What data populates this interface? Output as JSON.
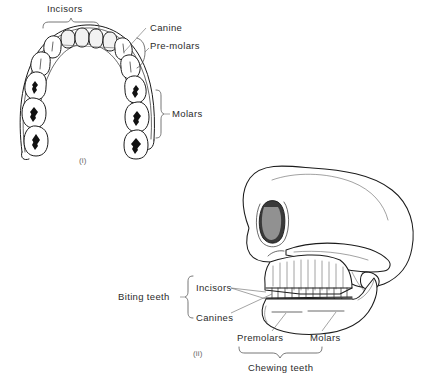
{
  "figure": {
    "background_color": "#ffffff",
    "ink_color": "#1b1b1b",
    "label_color": "#2b2b2b",
    "panels": [
      {
        "id": "panel-i",
        "caption": "(i)",
        "view": "upper jaw arch, occlusal view",
        "labels": [
          {
            "name": "incisors",
            "text": "Incisors",
            "x": 68,
            "y": 12
          },
          {
            "name": "canine",
            "text": "Canine",
            "x": 150,
            "y": 27
          },
          {
            "name": "pre-molars",
            "text": "Pre-molars",
            "x": 150,
            "y": 45
          },
          {
            "name": "molars",
            "text": "Molars",
            "x": 172,
            "y": 114
          }
        ],
        "tooth_groups": [
          {
            "name": "incisors",
            "count": 4,
            "marking": "none"
          },
          {
            "name": "canines",
            "count": 2,
            "marking": "single-ridge"
          },
          {
            "name": "pre-molars",
            "count": 4,
            "marking": "single-ridge"
          },
          {
            "name": "molars",
            "count": 6,
            "marking": "cusp-star"
          }
        ]
      },
      {
        "id": "panel-ii",
        "caption": "(ii)",
        "view": "skull, lateral view",
        "labels": [
          {
            "name": "biting-teeth",
            "text": "Biting teeth",
            "x": 118,
            "y": 301
          },
          {
            "name": "incisors",
            "text": "Incisors",
            "x": 196,
            "y": 288
          },
          {
            "name": "canines",
            "text": "Canines",
            "x": 196,
            "y": 318
          },
          {
            "name": "premolars",
            "text": "Premolars",
            "x": 257,
            "y": 338
          },
          {
            "name": "molars",
            "text": "Molars",
            "x": 320,
            "y": 338
          },
          {
            "name": "chewing-teeth",
            "text": "Chewing teeth",
            "x": 281,
            "y": 368
          }
        ],
        "anatomy_parts": [
          "cranium",
          "frontal bone",
          "orbit",
          "zygomatic arch",
          "nasal aperture",
          "maxilla",
          "mandible",
          "upper tooth row",
          "lower tooth row"
        ]
      }
    ]
  }
}
